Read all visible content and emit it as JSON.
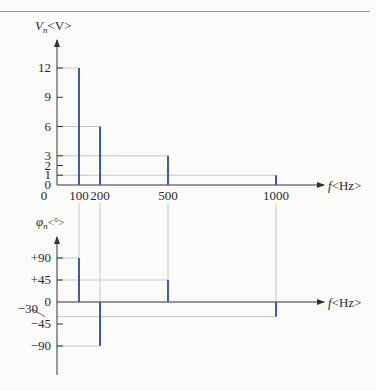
{
  "colors": {
    "bar": "#3c5bb5",
    "axis": "#333333",
    "guide": "#c8c8c8",
    "rule": "#8e96c0"
  },
  "chart_data": [
    {
      "type": "bar",
      "subtype": "stem",
      "title": "Amplitude spectrum",
      "ylabel": "V_n<V>",
      "ylabel_main": "V",
      "ylabel_sub": "n",
      "ylabel_unit": "<V>",
      "xlabel": "f<Hz>",
      "xlabel_main": "f",
      "xlabel_unit": "<Hz>",
      "x": [
        100,
        200,
        500,
        1000
      ],
      "values": [
        12,
        6,
        3,
        1
      ],
      "x_ticks": [
        "0",
        "100",
        "200",
        "500",
        "1000"
      ],
      "y_ticks": [
        "0",
        "1",
        "2",
        "3",
        "6",
        "9",
        "12"
      ],
      "ylim": [
        0,
        13
      ],
      "grid": false
    },
    {
      "type": "bar",
      "subtype": "stem",
      "title": "Phase spectrum",
      "ylabel": "φ_n<°>",
      "ylabel_main": "φ",
      "ylabel_sub": "n",
      "ylabel_unit": "<°>",
      "xlabel": "f<Hz>",
      "xlabel_main": "f",
      "xlabel_unit": "<Hz>",
      "x": [
        100,
        200,
        500,
        1000
      ],
      "values": [
        90,
        -90,
        45,
        -30
      ],
      "y_ticks": [
        "+90",
        "+45",
        "0",
        "−30",
        "−45",
        "−90"
      ],
      "ylim": [
        -120,
        120
      ],
      "grid": false
    }
  ]
}
